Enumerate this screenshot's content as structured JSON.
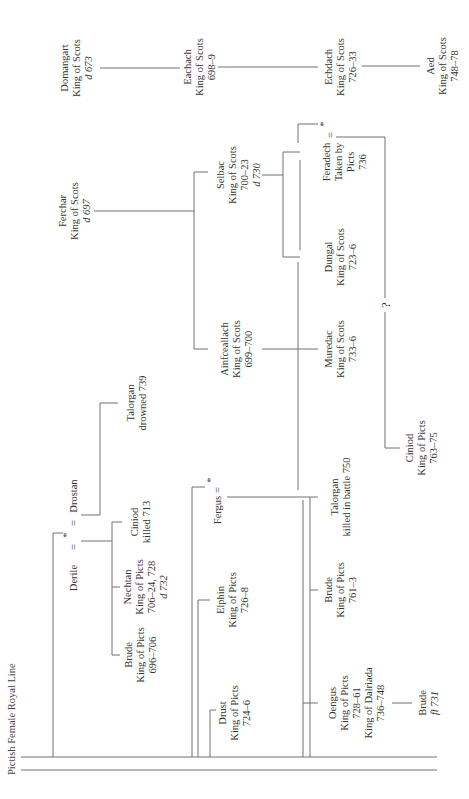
{
  "title": "Pictish Female Royal Line",
  "orientation": "rotated-90-ccw",
  "nodes": {
    "derile_union": {
      "left": "Derile",
      "eq1": "=",
      "star": "*",
      "eq2": "=",
      "right": "Drostan"
    },
    "brude_1": {
      "name": "Brude",
      "title": "King of Picts",
      "dates": "696–706"
    },
    "nechtan": {
      "name": "Nechtan",
      "title": "King of Picts",
      "dates": "706–24, 728",
      "death": "d 732"
    },
    "ciniod_1": {
      "name": "Ciniod",
      "note": "killed 713"
    },
    "talorgan_1": {
      "name": "Talorgan",
      "note": "drowned 739"
    },
    "domangart": {
      "name": "Domangart",
      "title": "King of Scots",
      "death": "d 673"
    },
    "ferchar": {
      "name": "Ferchar",
      "title": "King of Scots",
      "death": "d 697"
    },
    "eachach": {
      "name": "Eachach",
      "title": "King of Scots",
      "dates": "698–9"
    },
    "selbac": {
      "name": "Selbac",
      "title": "King of Scots",
      "dates": "700–23",
      "death": "d 730"
    },
    "ainfceallach": {
      "name": "Ainfceallach",
      "title": "King of Scots",
      "dates": "699–700"
    },
    "fergus_union": {
      "left": "Fergus",
      "eq": "=",
      "star": "*"
    },
    "elphin": {
      "name": "Elphin",
      "title": "King of Picts",
      "dates": "726–8"
    },
    "drust": {
      "name": "Drust",
      "title": "King of Picts",
      "dates": "724–6"
    },
    "echdach": {
      "name": "Echdach",
      "title": "King of Scots",
      "dates": "726–33"
    },
    "aed": {
      "name": "Aed",
      "title": "King of Scots",
      "dates": "748–78"
    },
    "feradech_union": {
      "name": "Feradech",
      "eq": "=",
      "star": "*",
      "note1": "Taken by",
      "note2": "Picts",
      "dates": "736"
    },
    "dungal": {
      "name": "Dungal",
      "title": "King of Scots",
      "dates": "723–6"
    },
    "muredac": {
      "name": "Muredac",
      "title": "King of Scots",
      "dates": "733–6"
    },
    "uncertain": {
      "mark": "?"
    },
    "ciniod_2": {
      "name": "Ciniod",
      "title": "King of Picts",
      "dates": "763–75"
    },
    "talorgan_2": {
      "name": "Talorgan",
      "note": "killed in battle 750"
    },
    "brude_2": {
      "name": "Brude",
      "title": "King of Picts",
      "dates": "761–3"
    },
    "oengus": {
      "name": "Oengus",
      "title": "King of Picts",
      "dates": "728–61",
      "title2": "King of Dalriada",
      "dates2": "736–748"
    },
    "brude_3": {
      "name": "Brude",
      "floruit": "fl 731"
    }
  }
}
